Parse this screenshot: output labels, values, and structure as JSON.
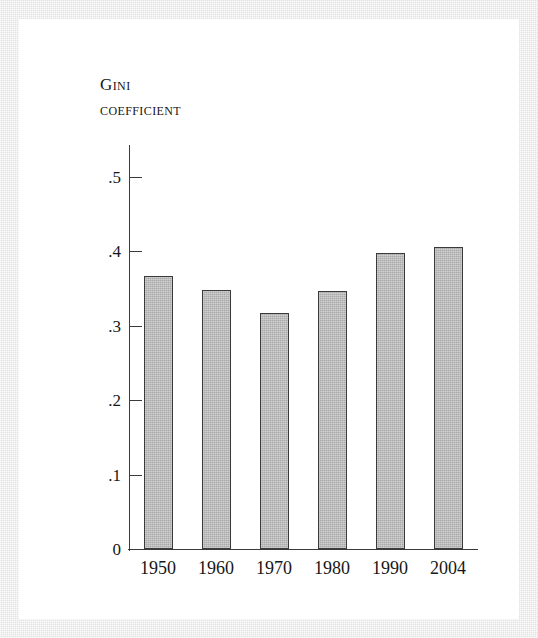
{
  "figure": {
    "title_lines": [
      "Gini",
      "coefficient"
    ]
  },
  "chart_data": {
    "type": "bar",
    "title": "Gini coefficient",
    "xlabel": "",
    "ylabel": "Gini coefficient",
    "categories": [
      "1950",
      "1960",
      "1970",
      "1980",
      "1990",
      "2004"
    ],
    "values": [
      0.366,
      0.348,
      0.317,
      0.346,
      0.397,
      0.405
    ],
    "ylim": [
      0,
      0.55
    ],
    "ytick_values": [
      0,
      0.1,
      0.2,
      0.3,
      0.4,
      0.5
    ],
    "ytick_labels": [
      "0",
      ".1",
      ".2",
      ".3",
      ".4",
      ".5"
    ],
    "grid": false,
    "legend": null,
    "bar_color": "#a9a9a9",
    "bar_edge_color": "#3a3a3a",
    "axis_color": "#3b3b3b",
    "background_color": "#ffffff",
    "frame_color": "#e2e2e2"
  }
}
